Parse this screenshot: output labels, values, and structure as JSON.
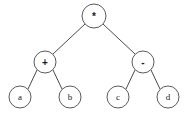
{
  "diagram": {
    "expression": "(a + b) * (c - d)",
    "background_color": "#ffffff",
    "node_stroke_color": "#5a5a5a",
    "edge_stroke_color": "#4a4a4a",
    "label_color": "#1a1a1a",
    "nodes": [
      {
        "id": "root",
        "label": "*",
        "kind": "operator",
        "cx": 94,
        "cy": 16,
        "r": 12
      },
      {
        "id": "left-op",
        "label": "+",
        "kind": "operator",
        "cx": 45,
        "cy": 62,
        "r": 11
      },
      {
        "id": "right-op",
        "label": "-",
        "kind": "operator",
        "cx": 143,
        "cy": 62,
        "r": 11
      },
      {
        "id": "leaf-a",
        "label": "a",
        "kind": "operand",
        "cx": 20,
        "cy": 97,
        "r": 11
      },
      {
        "id": "leaf-b",
        "label": "b",
        "kind": "operand",
        "cx": 70,
        "cy": 97,
        "r": 11
      },
      {
        "id": "leaf-c",
        "label": "c",
        "kind": "operand",
        "cx": 118,
        "cy": 97,
        "r": 11
      },
      {
        "id": "leaf-d",
        "label": "d",
        "kind": "operand",
        "cx": 168,
        "cy": 97,
        "r": 11
      }
    ],
    "edges": [
      {
        "id": "root-to-left-op",
        "from": "root",
        "to": "left-op",
        "x1": 85,
        "y1": 24,
        "x2": 53,
        "y2": 54
      },
      {
        "id": "root-to-right-op",
        "from": "root",
        "to": "right-op",
        "x1": 103,
        "y1": 24,
        "x2": 135,
        "y2": 54
      },
      {
        "id": "left-op-to-a",
        "from": "left-op",
        "to": "leaf-a",
        "x1": 37,
        "y1": 70,
        "x2": 28,
        "y2": 89
      },
      {
        "id": "left-op-to-b",
        "from": "left-op",
        "to": "leaf-b",
        "x1": 53,
        "y1": 70,
        "x2": 62,
        "y2": 89
      },
      {
        "id": "right-op-to-c",
        "from": "right-op",
        "to": "leaf-c",
        "x1": 135,
        "y1": 70,
        "x2": 126,
        "y2": 89
      },
      {
        "id": "right-op-to-d",
        "from": "right-op",
        "to": "leaf-d",
        "x1": 151,
        "y1": 70,
        "x2": 160,
        "y2": 89
      }
    ]
  }
}
